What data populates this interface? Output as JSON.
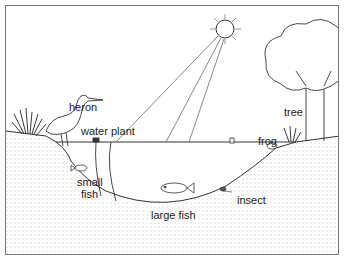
{
  "diagram": {
    "type": "pond ecosystem illustration",
    "colors": {
      "line": "#333333",
      "ground_dot": "#bbbbbb",
      "frame": "#777777",
      "background": "#ffffff"
    },
    "labels": {
      "heron": "heron",
      "water_plant": "water plant",
      "small_fish": "small",
      "small_fish_2": "fish",
      "large_fish": "large fish",
      "insect": "insect",
      "frog": "frog",
      "tree": "tree"
    },
    "elements": [
      {
        "name": "sun",
        "icon": "sun-icon"
      },
      {
        "name": "sun rays",
        "icon": "light-ray-icon"
      },
      {
        "name": "tree",
        "icon": "tree-icon"
      },
      {
        "name": "heron",
        "icon": "heron-icon"
      },
      {
        "name": "reeds",
        "icon": "reeds-icon"
      },
      {
        "name": "water plant",
        "icon": "water-plant-icon"
      },
      {
        "name": "small fish",
        "icon": "small-fish-icon"
      },
      {
        "name": "large fish",
        "icon": "large-fish-icon"
      },
      {
        "name": "insect",
        "icon": "insect-icon"
      },
      {
        "name": "frog",
        "icon": "frog-icon"
      },
      {
        "name": "pond",
        "icon": "pond-icon"
      },
      {
        "name": "ground",
        "icon": "ground-icon"
      }
    ]
  }
}
